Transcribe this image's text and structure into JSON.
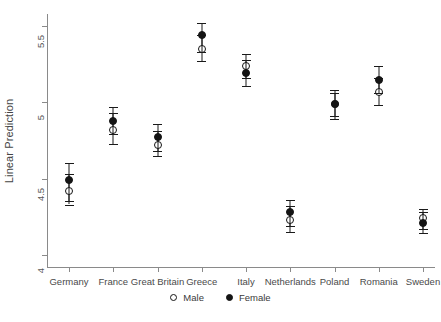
{
  "chart_data": {
    "type": "scatter",
    "title": "",
    "subtitle": "",
    "xlabel": "",
    "ylabel": "Linear Prediction",
    "categories": [
      "Germany",
      "France",
      "Great Britain",
      "Greece",
      "Italy",
      "Netherlands",
      "Poland",
      "Romania",
      "Sweden"
    ],
    "ylim": [
      3.92,
      5.58
    ],
    "yticks": [
      4,
      4.5,
      5,
      5.5
    ],
    "ytick_labels": [
      "4",
      "4.5",
      "5",
      "5.5"
    ],
    "grid": false,
    "legend_position": "bottom-center",
    "error_bars": "95% confidence interval",
    "series": [
      {
        "name": "Male",
        "marker": "open-circle",
        "values": [
          4.42,
          4.82,
          4.72,
          5.35,
          5.24,
          4.23,
          4.99,
          5.07,
          4.24
        ],
        "ci_low": [
          4.33,
          4.73,
          4.65,
          5.27,
          5.16,
          4.15,
          4.91,
          4.98,
          4.17
        ],
        "ci_high": [
          4.53,
          4.93,
          4.81,
          5.44,
          5.32,
          4.32,
          5.06,
          5.16,
          4.3
        ]
      },
      {
        "name": "Female",
        "marker": "filled-circle",
        "values": [
          4.49,
          4.88,
          4.77,
          5.44,
          5.19,
          4.28,
          4.99,
          5.15,
          4.21
        ],
        "ci_low": [
          4.35,
          4.79,
          4.68,
          5.33,
          5.11,
          4.19,
          4.89,
          5.06,
          4.14
        ],
        "ci_high": [
          4.6,
          4.97,
          4.86,
          5.52,
          5.28,
          4.36,
          5.08,
          5.24,
          4.28
        ]
      }
    ]
  },
  "axis": {
    "y_title": "Linear Prediction"
  },
  "legend": {
    "items": [
      {
        "label": "Male",
        "marker": "open-circle"
      },
      {
        "label": "Female",
        "marker": "filled-circle"
      }
    ]
  }
}
